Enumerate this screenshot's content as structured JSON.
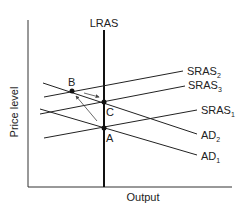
{
  "diagram": {
    "type": "AS-AD economic diagram",
    "axes": {
      "y_label": "Price level",
      "x_label": "Output"
    },
    "curves": [
      {
        "id": "lras",
        "label": "LRAS",
        "sub": ""
      },
      {
        "id": "sras1",
        "label": "SRAS",
        "sub": "1"
      },
      {
        "id": "sras2",
        "label": "SRAS",
        "sub": "2"
      },
      {
        "id": "sras3",
        "label": "SRAS",
        "sub": "3"
      },
      {
        "id": "ad1",
        "label": "AD",
        "sub": "1"
      },
      {
        "id": "ad2",
        "label": "AD",
        "sub": "2"
      }
    ],
    "points": [
      {
        "id": "A",
        "label": "A"
      },
      {
        "id": "B",
        "label": "B"
      },
      {
        "id": "C",
        "label": "C"
      }
    ],
    "arrows": [
      {
        "from": "A",
        "to": "B"
      },
      {
        "from": "B",
        "to": "C"
      }
    ]
  }
}
